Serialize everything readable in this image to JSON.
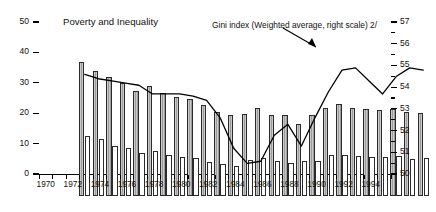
{
  "figure": {
    "title": "Poverty and Inequality",
    "annotation": "Gini index (Weighted average, right scale) 2/"
  },
  "axes": {
    "left_ticks": [
      "0",
      "10",
      "20",
      "30",
      "40",
      "50"
    ],
    "right_ticks": [
      "50",
      "51",
      "52",
      "53",
      "54",
      "55",
      "56",
      "57"
    ],
    "x_ticks": [
      "1970",
      "1972",
      "1974",
      "1976",
      "1978",
      "1980",
      "1982",
      "1984",
      "1986",
      "1988",
      "1990",
      "1992",
      "1994"
    ]
  },
  "colors": {
    "axis": "#000000",
    "bar_shaded_light": "#c9c9c9",
    "bar_shaded_dark": "#9d9d9d",
    "bar_white": "#ffffff",
    "bar_outline": "#2b2b2b",
    "line": "#000000",
    "text": "#111111"
  },
  "chart_data": {
    "type": "bar",
    "title": "Poverty and Inequality",
    "xlabel": "",
    "ylabel": "",
    "ylim": [
      0,
      50
    ],
    "y2lim": [
      50,
      57
    ],
    "grid": false,
    "legend_position": "inline-annotation",
    "annotations": [
      {
        "text": "Gini index (Weighted average, right scale) 2/",
        "points_to_year": 1989,
        "axis": "right"
      }
    ],
    "x": [
      1970,
      1971,
      1972,
      1973,
      1974,
      1975,
      1976,
      1977,
      1978,
      1979,
      1980,
      1981,
      1982,
      1983,
      1984,
      1985,
      1986,
      1987,
      1988,
      1989,
      1990,
      1991,
      1992,
      1993,
      1994,
      1995
    ],
    "categories": [
      "1970",
      "1971",
      "1972",
      "1973",
      "1974",
      "1975",
      "1976",
      "1977",
      "1978",
      "1979",
      "1980",
      "1981",
      "1982",
      "1983",
      "1984",
      "1985",
      "1986",
      "1987",
      "1988",
      "1989",
      "1990",
      "1991",
      "1992",
      "1993",
      "1994",
      "1995"
    ],
    "series": [
      {
        "name": "Poverty (left scale)",
        "axis": "left",
        "style": "bar-shaded",
        "values": [
          44.0,
          41.0,
          39.0,
          37.2,
          34.6,
          36.2,
          34.0,
          32.6,
          31.8,
          30.0,
          27.6,
          26.8,
          27.0,
          29.0,
          26.6,
          26.8,
          23.6,
          26.6,
          29.0,
          30.2,
          28.8,
          28.6,
          28.2,
          28.6,
          27.6,
          27.2
        ]
      },
      {
        "name": "Extreme poverty / indigence (left scale)",
        "axis": "left",
        "style": "bar-white",
        "values": [
          19.6,
          18.8,
          16.4,
          15.8,
          14.2,
          14.8,
          13.4,
          12.8,
          12.4,
          11.2,
          10.4,
          10.0,
          11.8,
          12.6,
          11.4,
          11.0,
          11.4,
          11.6,
          13.4,
          13.6,
          13.0,
          12.8,
          12.8,
          13.0,
          12.2,
          12.6
        ]
      },
      {
        "name": "Gini index (Weighted average, right scale)",
        "axis": "right",
        "style": "line",
        "values": [
          55.6,
          55.4,
          55.3,
          55.2,
          55.1,
          54.7,
          54.7,
          54.7,
          54.6,
          54.4,
          53.6,
          52.2,
          51.5,
          51.6,
          52.8,
          53.3,
          52.3,
          53.6,
          54.8,
          55.8,
          55.9,
          55.3,
          54.7,
          55.5,
          55.9,
          55.8
        ]
      }
    ]
  }
}
